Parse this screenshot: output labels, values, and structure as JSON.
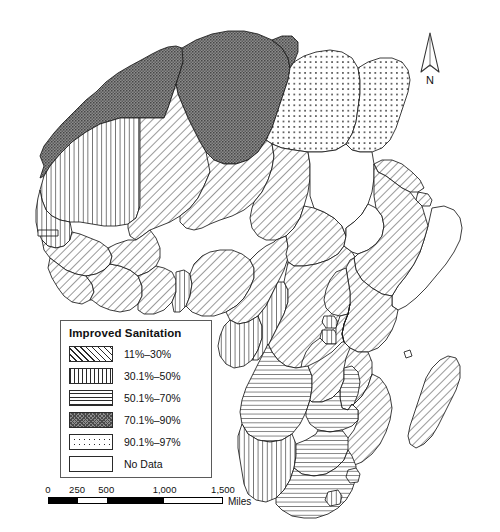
{
  "map": {
    "title": "Improved Sanitation in Africa",
    "subject": "Africa",
    "background_color": "#ffffff",
    "outline_color": "#1a1a1a"
  },
  "north_arrow": {
    "label": "N",
    "icon": "north-arrow-icon"
  },
  "legend": {
    "title": "Improved Sanitation",
    "items": [
      {
        "label": "11%–30%",
        "pattern": "diagonal-hatch",
        "class": "sw-diag",
        "range_low": 11,
        "range_high": 30
      },
      {
        "label": "30.1%–50%",
        "pattern": "vertical-lines",
        "class": "sw-vert",
        "range_low": 30.1,
        "range_high": 50
      },
      {
        "label": "50.1%–70%",
        "pattern": "horizontal-lines",
        "class": "sw-horz",
        "range_low": 50.1,
        "range_high": 70
      },
      {
        "label": "70.1%–90%",
        "pattern": "dark-stipple",
        "class": "sw-dark",
        "range_low": 70.1,
        "range_high": 90
      },
      {
        "label": "90.1%–97%",
        "pattern": "dotted",
        "class": "sw-dot",
        "range_low": 90.1,
        "range_high": 97
      },
      {
        "label": "No Data",
        "pattern": "blank",
        "class": "sw-none",
        "range_low": null,
        "range_high": null
      }
    ]
  },
  "scale_bar": {
    "units": "Miles",
    "ticks": [
      "0",
      "250",
      "500",
      "1,000",
      "1,500"
    ],
    "tick_positions_pct": [
      0,
      16.6,
      33.3,
      66.6,
      100
    ],
    "segments": [
      "fill",
      "empty",
      "fill",
      "empty"
    ]
  },
  "chart_data": {
    "type": "map",
    "title": "Improved Sanitation",
    "legend_position": "lower-left",
    "value_unit": "percent of population with improved sanitation",
    "classes": [
      "11%–30%",
      "30.1%–50%",
      "50.1%–70%",
      "70.1%–90%",
      "90.1%–97%",
      "No Data"
    ],
    "regions": [
      {
        "name": "Morocco",
        "class": "70.1%–90%"
      },
      {
        "name": "Algeria",
        "class": "70.1%–90%"
      },
      {
        "name": "Tunisia",
        "class": "70.1%–90%"
      },
      {
        "name": "Western Sahara",
        "class": "70.1%–90%"
      },
      {
        "name": "Libya",
        "class": "90.1%–97%"
      },
      {
        "name": "Egypt",
        "class": "90.1%–97%"
      },
      {
        "name": "Mauritania",
        "class": "30.1%–50%"
      },
      {
        "name": "Mali",
        "class": "11%–30%"
      },
      {
        "name": "Niger",
        "class": "11%–30%"
      },
      {
        "name": "Chad",
        "class": "11%–30%"
      },
      {
        "name": "Senegal",
        "class": "30.1%–50%"
      },
      {
        "name": "Gambia",
        "class": "30.1%–50%"
      },
      {
        "name": "Guinea-Bissau",
        "class": "11%–30%"
      },
      {
        "name": "Guinea",
        "class": "11%–30%"
      },
      {
        "name": "Sierra Leone",
        "class": "11%–30%"
      },
      {
        "name": "Liberia",
        "class": "11%–30%"
      },
      {
        "name": "Cote d'Ivoire",
        "class": "11%–30%"
      },
      {
        "name": "Burkina Faso",
        "class": "11%–30%"
      },
      {
        "name": "Ghana",
        "class": "11%–30%"
      },
      {
        "name": "Togo",
        "class": "11%–30%"
      },
      {
        "name": "Benin",
        "class": "30.1%–50%"
      },
      {
        "name": "Nigeria",
        "class": "11%–30%"
      },
      {
        "name": "Cameroon",
        "class": "11%–30%"
      },
      {
        "name": "Equatorial Guinea",
        "class": "30.1%–50%"
      },
      {
        "name": "Gabon",
        "class": "30.1%–50%"
      },
      {
        "name": "Republic of the Congo",
        "class": "30.1%–50%"
      },
      {
        "name": "Central African Republic",
        "class": "11%–30%"
      },
      {
        "name": "Democratic Republic of the Congo",
        "class": "11%–30%"
      },
      {
        "name": "Sudan",
        "class": "No Data"
      },
      {
        "name": "South Sudan",
        "class": "No Data"
      },
      {
        "name": "Eritrea",
        "class": "11%–30%"
      },
      {
        "name": "Djibouti",
        "class": "11%–30%"
      },
      {
        "name": "Ethiopia",
        "class": "11%–30%"
      },
      {
        "name": "Somalia",
        "class": "No Data"
      },
      {
        "name": "Kenya",
        "class": "11%–30%"
      },
      {
        "name": "Uganda",
        "class": "11%–30%"
      },
      {
        "name": "Rwanda",
        "class": "30.1%–50%"
      },
      {
        "name": "Burundi",
        "class": "30.1%–50%"
      },
      {
        "name": "Tanzania",
        "class": "11%–30%"
      },
      {
        "name": "Angola",
        "class": "50.1%–70%"
      },
      {
        "name": "Zambia",
        "class": "11%–30%"
      },
      {
        "name": "Malawi",
        "class": "50.1%–70%"
      },
      {
        "name": "Mozambique",
        "class": "11%–30%"
      },
      {
        "name": "Zimbabwe",
        "class": "50.1%–70%"
      },
      {
        "name": "Namibia",
        "class": "30.1%–50%"
      },
      {
        "name": "Botswana",
        "class": "50.1%–70%"
      },
      {
        "name": "South Africa",
        "class": "50.1%–70%"
      },
      {
        "name": "Lesotho",
        "class": "30.1%–50%"
      },
      {
        "name": "Swaziland",
        "class": "50.1%–70%"
      },
      {
        "name": "Madagascar",
        "class": "11%–30%"
      }
    ]
  }
}
